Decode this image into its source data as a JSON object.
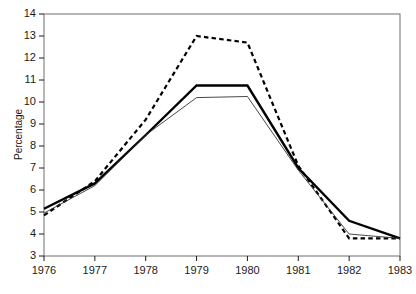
{
  "chart_data": {
    "type": "line",
    "title": "",
    "subtitle": "",
    "xlabel": "",
    "ylabel": "Percentage",
    "x": [
      1976,
      1977,
      1978,
      1979,
      1980,
      1981,
      1982,
      1983
    ],
    "xtick_labels": [
      "1976",
      "1977",
      "1978",
      "1979",
      "1980",
      "1981",
      "1982",
      "1983"
    ],
    "ytick_labels": [
      "3",
      "4",
      "5",
      "6",
      "7",
      "8",
      "9",
      "10",
      "11",
      "12",
      "13",
      "14"
    ],
    "ytick_values": [
      3,
      4,
      5,
      6,
      7,
      8,
      9,
      10,
      11,
      12,
      13,
      14
    ],
    "xlim": [
      1976,
      1983
    ],
    "ylim": [
      3,
      14
    ],
    "grid": false,
    "legend": "none",
    "series": [
      {
        "name": "dashed-series",
        "style": "dashed",
        "color": "#000000",
        "width": 2.2,
        "values": [
          4.85,
          6.4,
          9.2,
          13.0,
          12.7,
          7.1,
          3.8,
          3.8
        ]
      },
      {
        "name": "thick-solid-series",
        "style": "solid",
        "color": "#000000",
        "width": 2.4,
        "values": [
          5.15,
          6.3,
          8.5,
          10.75,
          10.75,
          7.0,
          4.6,
          3.8
        ]
      },
      {
        "name": "thin-solid-series",
        "style": "solid",
        "color": "#333333",
        "width": 0.9,
        "values": [
          4.95,
          6.2,
          8.5,
          10.2,
          10.25,
          6.9,
          4.0,
          3.8
        ]
      }
    ]
  },
  "axes": {
    "y_title": "Percentage"
  }
}
